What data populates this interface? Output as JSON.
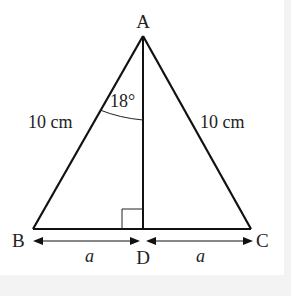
{
  "diagram": {
    "type": "isosceles-triangle",
    "vertices": {
      "A": "A",
      "B": "B",
      "C": "C",
      "D": "D"
    },
    "side_labels": {
      "AB": "10 cm",
      "AC": "10 cm"
    },
    "angle_label": "18°",
    "base_labels": {
      "BD": "a",
      "DC": "a"
    },
    "right_angle_at": "D"
  }
}
